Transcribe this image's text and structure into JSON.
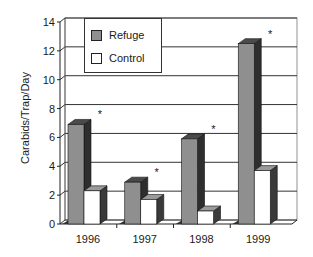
{
  "chart_data": {
    "type": "bar",
    "title": "",
    "xlabel": "",
    "ylabel": "Carabids/Trap/Day",
    "ylim": [
      0,
      14
    ],
    "yticks": [
      0,
      2,
      4,
      6,
      8,
      10,
      12,
      14
    ],
    "categories": [
      "1996",
      "1997",
      "1998",
      "1999"
    ],
    "series": [
      {
        "name": "Refuge",
        "color": "#8f8f8f",
        "side_color": "#2e2e2e",
        "values": [
          6.9,
          2.9,
          5.9,
          12.5
        ]
      },
      {
        "name": "Control",
        "color": "#ffffff",
        "side_color": "#3a3a3a",
        "values": [
          2.3,
          1.7,
          0.9,
          3.7
        ]
      }
    ],
    "annotations": [
      {
        "category": "1996",
        "text": "*"
      },
      {
        "category": "1997",
        "text": "*"
      },
      {
        "category": "1998",
        "text": "*"
      },
      {
        "category": "1999",
        "text": "*"
      }
    ],
    "grid": true,
    "legend_position": "top-left-inside",
    "style": "3d-column"
  },
  "legend": {
    "items": [
      {
        "label": "Refuge",
        "color": "#8f8f8f"
      },
      {
        "label": "Control",
        "color": "#ffffff"
      }
    ]
  },
  "axis": {
    "y_title": "Carabids/Trap/Day",
    "y_ticks": [
      "0",
      "2",
      "4",
      "6",
      "8",
      "10",
      "12",
      "14"
    ],
    "x_labels": [
      "1996",
      "1997",
      "1998",
      "1999"
    ]
  }
}
